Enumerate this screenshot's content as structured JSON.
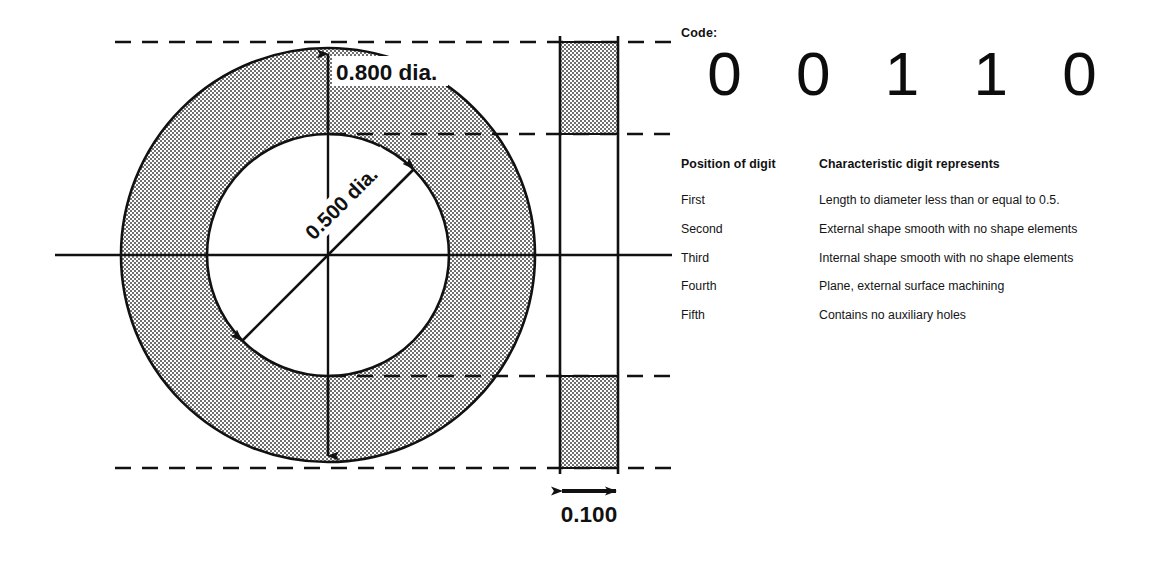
{
  "drawing": {
    "title": "Rotational part cross-section with Opitz code",
    "dimensions": {
      "outer_diameter": "0.800 dia.",
      "inner_diameter": "0.500 dia.",
      "thickness": "0.100"
    },
    "geometry": {
      "outer_diameter_value": 0.8,
      "inner_diameter_value": 0.5,
      "thickness_value": 0.1,
      "units": "inches"
    },
    "fill_color": "#9a9a9a",
    "line_color": "#111111"
  },
  "code_section": {
    "label": "Code:",
    "digits": [
      "0",
      "0",
      "1",
      "1",
      "0"
    ]
  },
  "table": {
    "headers": {
      "position": "Position of digit",
      "characteristic": "Characteristic digit represents"
    },
    "rows": [
      {
        "position": "First",
        "characteristic": "Length to diameter less than or equal to 0.5."
      },
      {
        "position": "Second",
        "characteristic": "External shape smooth with no shape elements"
      },
      {
        "position": "Third",
        "characteristic": "Internal shape smooth with no shape elements"
      },
      {
        "position": "Fourth",
        "characteristic": "Plane, external surface machining"
      },
      {
        "position": "Fifth",
        "characteristic": "Contains no auxiliary holes"
      }
    ]
  }
}
